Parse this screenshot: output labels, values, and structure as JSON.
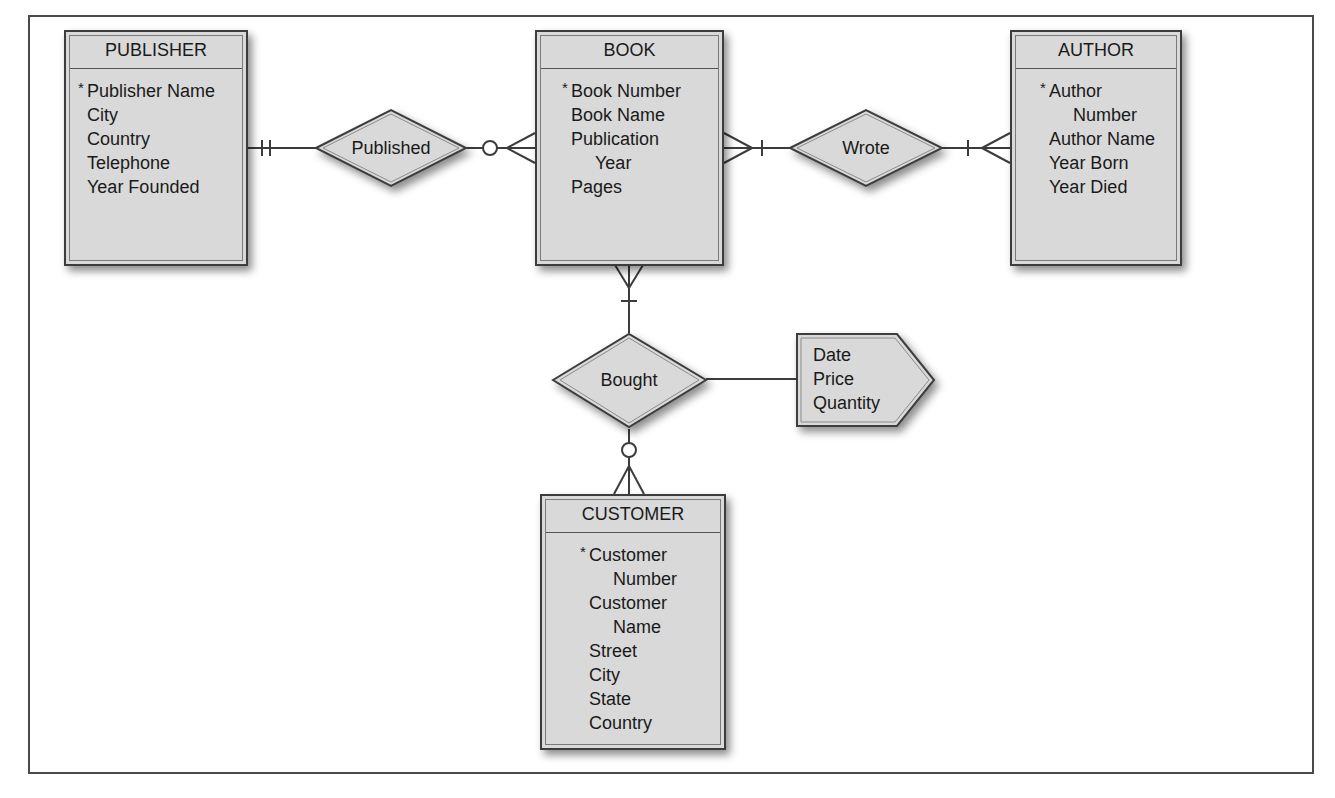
{
  "diagram": {
    "type": "entity-relationship",
    "entities": [
      {
        "id": "publisher",
        "name": "PUBLISHER",
        "attributes": [
          {
            "text": "Publisher Name",
            "key": true
          },
          {
            "text": "City"
          },
          {
            "text": "Country"
          },
          {
            "text": "Telephone"
          },
          {
            "text": "Year Founded"
          }
        ]
      },
      {
        "id": "book",
        "name": "BOOK",
        "attributes": [
          {
            "text": "Book Number",
            "key": true
          },
          {
            "text": "Book Name"
          },
          {
            "text": "Publication"
          },
          {
            "text": "Year",
            "continuation": true
          },
          {
            "text": "Pages"
          }
        ]
      },
      {
        "id": "author",
        "name": "AUTHOR",
        "attributes": [
          {
            "text": "Author",
            "key": true
          },
          {
            "text": "Number",
            "continuation": true
          },
          {
            "text": "Author Name"
          },
          {
            "text": "Year Born"
          },
          {
            "text": "Year Died"
          }
        ]
      },
      {
        "id": "customer",
        "name": "CUSTOMER",
        "attributes": [
          {
            "text": "Customer",
            "key": true
          },
          {
            "text": "Number",
            "continuation": true
          },
          {
            "text": "Customer"
          },
          {
            "text": "Name",
            "continuation": true
          },
          {
            "text": "Street"
          },
          {
            "text": "City"
          },
          {
            "text": "State"
          },
          {
            "text": "Country"
          }
        ]
      }
    ],
    "relationships": [
      {
        "id": "published",
        "label": "Published",
        "from": "PUBLISHER",
        "from_cardinality": "one-and-only-one",
        "to": "BOOK",
        "to_cardinality": "zero-or-many"
      },
      {
        "id": "wrote",
        "label": "Wrote",
        "from": "BOOK",
        "from_cardinality": "one-or-many",
        "to": "AUTHOR",
        "to_cardinality": "one-or-many"
      },
      {
        "id": "bought",
        "label": "Bought",
        "from": "BOOK",
        "from_cardinality": "one-or-many",
        "to": "CUSTOMER",
        "to_cardinality": "zero-or-many"
      }
    ],
    "relationship_attributes": {
      "relationship": "Bought",
      "attributes": [
        "Date",
        "Price",
        "Quantity"
      ]
    },
    "colors": {
      "box_fill": "#d9d9d9",
      "line": "#3c3c3c",
      "background": "#ffffff"
    }
  }
}
